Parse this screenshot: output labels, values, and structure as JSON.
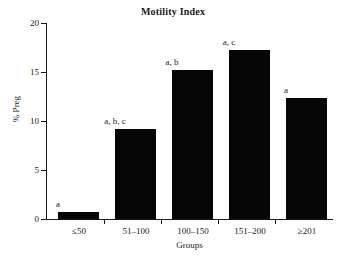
{
  "chart_data": {
    "type": "bar",
    "title": "Motility Index",
    "xlabel": "Groups",
    "ylabel": "% Preg",
    "categories": [
      "≤50",
      "51–100",
      "100–150",
      "151–200",
      "≥201"
    ],
    "values": [
      0.7,
      9.2,
      15.2,
      17.2,
      12.3
    ],
    "annotations": [
      "a",
      "a, b, c",
      "a, b",
      "a, c",
      "a"
    ],
    "ylim": [
      0,
      20
    ],
    "yticks": [
      0,
      5,
      10,
      15,
      20
    ],
    "ytick_labels": [
      "0",
      "5",
      "10",
      "15",
      "20"
    ],
    "grid": false,
    "legend": null,
    "bar_color": "#050505",
    "axis_color": "#1a1a1a",
    "background": "#ffffff"
  }
}
